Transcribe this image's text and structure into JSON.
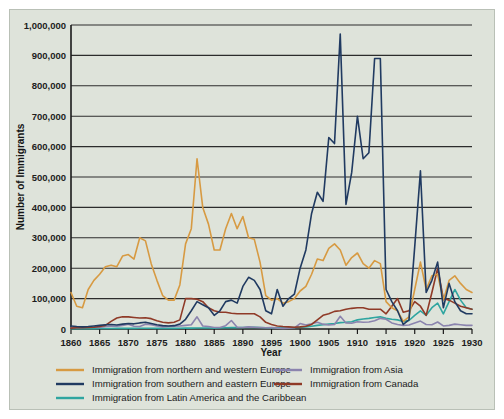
{
  "chart_data": {
    "type": "line",
    "title": "",
    "xlabel": "Year",
    "ylabel": "Number of Immigrants",
    "xlim": [
      1860,
      1930
    ],
    "ylim": [
      0,
      1000000
    ],
    "grid": true,
    "legend_position": "bottom",
    "xticks": [
      "1860",
      "1865",
      "1870",
      "1875",
      "1880",
      "1885",
      "1890",
      "1895",
      "1900",
      "1905",
      "1910",
      "1915",
      "1920",
      "1925",
      "1930"
    ],
    "yticks": [
      "0",
      "100,000",
      "200,000",
      "300,000",
      "400,000",
      "500,000",
      "600,000",
      "700,000",
      "800,000",
      "900,000",
      "1,000,000"
    ],
    "ytick_values": [
      0,
      100000,
      200000,
      300000,
      400000,
      500000,
      600000,
      700000,
      800000,
      900000,
      1000000
    ],
    "x": [
      1860,
      1861,
      1862,
      1863,
      1864,
      1865,
      1866,
      1867,
      1868,
      1869,
      1870,
      1871,
      1872,
      1873,
      1874,
      1875,
      1876,
      1877,
      1878,
      1879,
      1880,
      1881,
      1882,
      1883,
      1884,
      1885,
      1886,
      1887,
      1888,
      1889,
      1890,
      1891,
      1892,
      1893,
      1894,
      1895,
      1896,
      1897,
      1898,
      1899,
      1900,
      1901,
      1902,
      1903,
      1904,
      1905,
      1906,
      1907,
      1908,
      1909,
      1910,
      1911,
      1912,
      1913,
      1914,
      1915,
      1916,
      1917,
      1918,
      1919,
      1920,
      1921,
      1922,
      1923,
      1924,
      1925,
      1926,
      1927,
      1928,
      1929,
      1930
    ],
    "series": [
      {
        "name": "Immigration from northern and western Europe",
        "color": "#d79a42",
        "values": [
          120000,
          75000,
          70000,
          130000,
          160000,
          180000,
          205000,
          210000,
          205000,
          240000,
          245000,
          230000,
          300000,
          290000,
          215000,
          160000,
          110000,
          95000,
          95000,
          145000,
          280000,
          330000,
          560000,
          400000,
          345000,
          260000,
          260000,
          330000,
          380000,
          330000,
          370000,
          300000,
          295000,
          220000,
          110000,
          95000,
          100000,
          85000,
          90000,
          100000,
          125000,
          140000,
          180000,
          230000,
          225000,
          265000,
          280000,
          260000,
          210000,
          235000,
          250000,
          215000,
          200000,
          225000,
          215000,
          90000,
          70000,
          60000,
          25000,
          40000,
          130000,
          220000,
          130000,
          175000,
          180000,
          95000,
          160000,
          175000,
          150000,
          130000,
          120000
        ]
      },
      {
        "name": "Immigration from southern and eastern Europe",
        "color": "#203a61",
        "values": [
          10000,
          8000,
          7000,
          8000,
          10000,
          12000,
          14000,
          15000,
          13000,
          16000,
          18000,
          17000,
          20000,
          22000,
          18000,
          14000,
          11000,
          10000,
          11000,
          16000,
          32000,
          60000,
          90000,
          80000,
          70000,
          45000,
          60000,
          90000,
          95000,
          85000,
          140000,
          170000,
          160000,
          130000,
          60000,
          50000,
          130000,
          75000,
          100000,
          115000,
          200000,
          260000,
          380000,
          450000,
          420000,
          630000,
          610000,
          970000,
          410000,
          515000,
          700000,
          560000,
          580000,
          890000,
          890000,
          130000,
          90000,
          60000,
          15000,
          30000,
          270000,
          520000,
          120000,
          160000,
          220000,
          70000,
          150000,
          90000,
          60000,
          50000,
          50000
        ]
      },
      {
        "name": "Immigration from Latin America and the Caribbean",
        "color": "#2fa5a0",
        "values": [
          1000,
          1000,
          1000,
          1000,
          1000,
          1500,
          1500,
          1500,
          2000,
          2000,
          2000,
          2000,
          2500,
          2500,
          2500,
          2000,
          2000,
          2000,
          2000,
          2500,
          3000,
          3000,
          3500,
          3500,
          3500,
          3000,
          3500,
          4000,
          4500,
          4500,
          5000,
          5500,
          5500,
          5000,
          4000,
          3500,
          4000,
          4000,
          4500,
          5000,
          6000,
          7000,
          9000,
          12000,
          14000,
          16000,
          18000,
          21000,
          22000,
          24000,
          30000,
          33000,
          35000,
          38000,
          40000,
          35000,
          32000,
          30000,
          25000,
          28000,
          45000,
          60000,
          45000,
          70000,
          85000,
          50000,
          90000,
          130000,
          95000,
          70000,
          65000
        ]
      },
      {
        "name": "Immigration from Asia",
        "color": "#8b84ae",
        "values": [
          5000,
          6000,
          5000,
          6000,
          6000,
          5000,
          8000,
          9000,
          9000,
          12000,
          16000,
          9000,
          8000,
          16000,
          14000,
          10000,
          7000,
          8000,
          9000,
          10000,
          12000,
          14000,
          40000,
          10000,
          8000,
          5000,
          5000,
          11000,
          28000,
          6000,
          5000,
          7000,
          6000,
          5000,
          4000,
          5000,
          3000,
          2000,
          3000,
          4000,
          18000,
          13000,
          17000,
          22000,
          16000,
          13000,
          15000,
          42000,
          20000,
          19000,
          24000,
          22000,
          23000,
          27000,
          35000,
          32000,
          20000,
          15000,
          12000,
          13000,
          20000,
          26000,
          15000,
          14000,
          23000,
          10000,
          12000,
          16000,
          14000,
          12000,
          12000
        ]
      },
      {
        "name": "Immigration from Canada",
        "color": "#8f3a27",
        "values": [
          3000,
          4000,
          4000,
          5000,
          6000,
          8000,
          12000,
          25000,
          36000,
          40000,
          40000,
          38000,
          36000,
          37000,
          34000,
          27000,
          22000,
          20000,
          22000,
          30000,
          100000,
          100000,
          98000,
          90000,
          70000,
          60000,
          55000,
          55000,
          52000,
          50000,
          50000,
          50000,
          50000,
          40000,
          22000,
          15000,
          10000,
          8000,
          7000,
          6000,
          7000,
          9000,
          15000,
          30000,
          45000,
          50000,
          58000,
          60000,
          65000,
          68000,
          70000,
          70000,
          65000,
          65000,
          65000,
          50000,
          75000,
          100000,
          55000,
          60000,
          90000,
          75000,
          45000,
          120000,
          200000,
          100000,
          95000,
          85000,
          75000,
          70000,
          65000
        ]
      }
    ]
  },
  "legend": {
    "entries": [
      {
        "label": "Immigration from northern and western Europe",
        "color": "#d79a42"
      },
      {
        "label": "Immigration from southern and eastern Europe",
        "color": "#203a61"
      },
      {
        "label": "Immigration from Latin America and the Caribbean",
        "color": "#2fa5a0"
      },
      {
        "label": "Immigration from Asia",
        "color": "#8b84ae"
      },
      {
        "label": "Immigration from Canada",
        "color": "#8f3a27"
      }
    ]
  }
}
